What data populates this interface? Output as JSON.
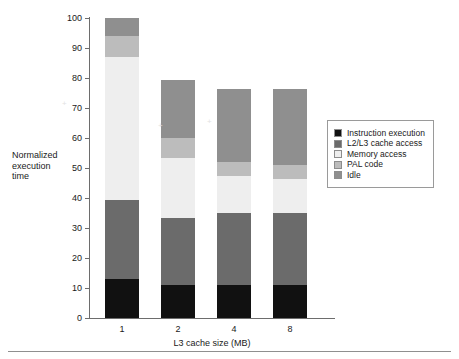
{
  "chart_data": {
    "type": "bar",
    "stacked": true,
    "title": "",
    "xlabel": "L3 cache size (MB)",
    "ylabel": "Normalized execution time",
    "categories": [
      "1",
      "2",
      "4",
      "8"
    ],
    "ylim": [
      0,
      100
    ],
    "yticks": [
      0,
      10,
      20,
      30,
      40,
      50,
      60,
      70,
      80,
      90,
      100
    ],
    "grid": false,
    "legend_position": "right-middle",
    "series": [
      {
        "name": "Instruction execution",
        "color": "#111111",
        "values": [
          13,
          11,
          11,
          11
        ]
      },
      {
        "name": "L2/L3 cache access",
        "color": "#6b6b6b",
        "values": [
          26.5,
          22.5,
          24,
          24
        ]
      },
      {
        "name": "Memory access",
        "color": "#eeeeee",
        "values": [
          47.5,
          20,
          12.5,
          11.5
        ]
      },
      {
        "name": "PAL code",
        "color": "#bcbcbc",
        "values": [
          7,
          6.5,
          4.5,
          4.5
        ]
      },
      {
        "name": "Idle",
        "color": "#8f8f8f",
        "values": [
          6,
          19.5,
          24.5,
          25.5
        ]
      }
    ],
    "totals": [
      100,
      79.5,
      76.5,
      76.5
    ]
  },
  "axes": {
    "y_title_lines": [
      "Normalized",
      "execution",
      "time"
    ],
    "x_title": "L3 cache size (MB)"
  },
  "legend": {
    "items": [
      {
        "label": "Instruction execution",
        "color": "#111111"
      },
      {
        "label": "L2/L3 cache access",
        "color": "#6b6b6b"
      },
      {
        "label": "Memory access",
        "color": "#eeeeee"
      },
      {
        "label": "PAL code",
        "color": "#bcbcbc"
      },
      {
        "label": "Idle",
        "color": "#8f8f8f"
      }
    ]
  }
}
